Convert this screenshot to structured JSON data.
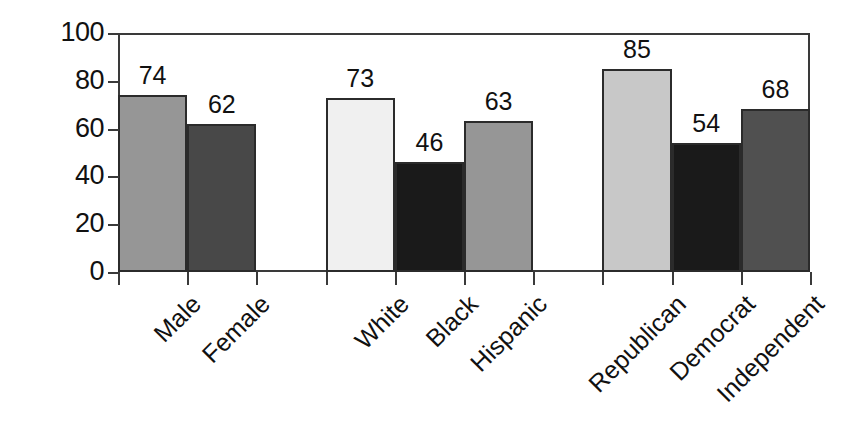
{
  "chart_data": {
    "type": "bar",
    "title": "",
    "subtitle": "",
    "xlabel": "",
    "ylabel": "",
    "ylim": [
      0,
      100
    ],
    "yticks": [
      0,
      20,
      40,
      60,
      80,
      100
    ],
    "grid": false,
    "legend": "none",
    "categories": [
      "Male",
      "Female",
      "White",
      "Black",
      "Hispanic",
      "Republican",
      "Democrat",
      "Independent"
    ],
    "values": [
      74,
      62,
      73,
      46,
      63,
      85,
      54,
      68
    ],
    "value_labels": [
      "74",
      "62",
      "73",
      "46",
      "63",
      "85",
      "54",
      "68"
    ],
    "groups": [
      {
        "name": "Gender",
        "categories": [
          "Male",
          "Female"
        ]
      },
      {
        "name": "Race",
        "categories": [
          "White",
          "Black",
          "Hispanic"
        ]
      },
      {
        "name": "Party",
        "categories": [
          "Republican",
          "Democrat",
          "Independent"
        ]
      }
    ],
    "bars": [
      {
        "label": "Male",
        "value": 74,
        "value_label": "74",
        "color": "#969696",
        "slot": 0
      },
      {
        "label": "Female",
        "value": 62,
        "value_label": "62",
        "color": "#484848",
        "slot": 1
      },
      {
        "label": "White",
        "value": 73,
        "value_label": "73",
        "color": "#f0f0f0",
        "slot": 3
      },
      {
        "label": "Black",
        "value": 46,
        "value_label": "46",
        "color": "#1a1a1a",
        "slot": 4
      },
      {
        "label": "Hispanic",
        "value": 63,
        "value_label": "63",
        "color": "#969696",
        "slot": 5
      },
      {
        "label": "Republican",
        "value": 85,
        "value_label": "85",
        "color": "#c8c8c8",
        "slot": 7
      },
      {
        "label": "Democrat",
        "value": 54,
        "value_label": "54",
        "color": "#1a1a1a",
        "slot": 8
      },
      {
        "label": "Independent",
        "value": 68,
        "value_label": "68",
        "color": "#505050",
        "slot": 9
      }
    ],
    "axis_tick_labels": {
      "y": [
        "0",
        "20",
        "40",
        "60",
        "80",
        "100"
      ]
    },
    "colors": {
      "axis": "#3a3a3a",
      "bar_outline": "#2b2b2b",
      "text": "#111111",
      "background": "#ffffff"
    }
  },
  "yticks": [
    {
      "label": "100",
      "value": 100
    },
    {
      "label": "80",
      "value": 80
    },
    {
      "label": "60",
      "value": 60
    },
    {
      "label": "40",
      "value": 40
    },
    {
      "label": "20",
      "value": 20
    },
    {
      "label": "0",
      "value": 0
    }
  ]
}
